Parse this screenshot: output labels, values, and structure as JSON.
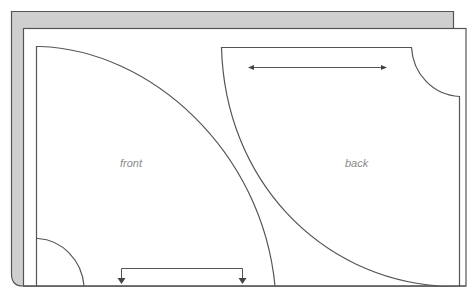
{
  "diagram": {
    "title": "",
    "colors": {
      "stroke": "#555555",
      "back_sheet_fill": "#cfcfcf",
      "front_sheet_fill": "#ffffff",
      "label": "#8a8a8a",
      "arrow": "#555555"
    },
    "pieces": [
      {
        "name": "front",
        "label": "front",
        "grainline": "horizontal-bracket with down arrows at bottom (place on fold)"
      },
      {
        "name": "back",
        "label": "back",
        "grainline": "double-headed horizontal arrow at top"
      }
    ]
  }
}
